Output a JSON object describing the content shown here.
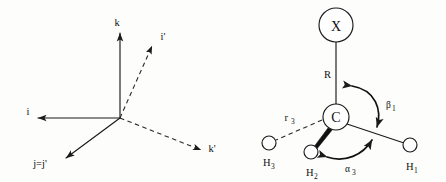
{
  "figure": {
    "background_color": "#fdfdfb",
    "ink_color": "#111111"
  },
  "left_panel": {
    "name": "coordinate-axes-diagram",
    "description": "Two overlaid right-handed coordinate frames sharing a common origin; unprimed frame drawn with solid arrows, primed frame drawn with dashed arrows, with j coincident with j-prime.",
    "axes": [
      {
        "id": "k",
        "label": "k",
        "style": "solid",
        "direction": "up"
      },
      {
        "id": "i",
        "label": "i",
        "style": "solid",
        "direction": "left"
      },
      {
        "id": "j",
        "label": "j=j'",
        "style": "solid",
        "direction": "down-left"
      },
      {
        "id": "iprime",
        "label": "i'",
        "style": "dashed",
        "direction": "up-right"
      },
      {
        "id": "kprime",
        "label": "k'",
        "style": "dashed",
        "direction": "down-right"
      }
    ]
  },
  "right_panel": {
    "name": "molecule-diagram",
    "description": "Substituted methyl group: central carbon bonded to substituent X and three hydrogens, annotated with bond length R, distance r3, bend angle beta1 and angle alpha3.",
    "atoms": [
      {
        "id": "X",
        "label": "X",
        "shape": "circle",
        "radius_px": 17
      },
      {
        "id": "C",
        "label": "C",
        "shape": "circle",
        "radius_px": 13
      },
      {
        "id": "H1",
        "label": "H",
        "subscript": "1",
        "shape": "circle",
        "radius_px": 7
      },
      {
        "id": "H2",
        "label": "H",
        "subscript": "2",
        "shape": "circle",
        "radius_px": 7
      },
      {
        "id": "H3",
        "label": "H",
        "subscript": "3",
        "shape": "circle",
        "radius_px": 7
      }
    ],
    "bonds": [
      {
        "from": "C",
        "to": "X",
        "style": "solid",
        "label": "R"
      },
      {
        "from": "C",
        "to": "H1",
        "style": "solid",
        "label": ""
      },
      {
        "from": "C",
        "to": "H2",
        "style": "wedge",
        "label": ""
      },
      {
        "from": "C",
        "to": "H3",
        "style": "dashed",
        "label": "r",
        "label_subscript": "3"
      }
    ],
    "angle_annotations": [
      {
        "id": "beta1",
        "label": "β",
        "subscript": "1",
        "between": [
          "C-X",
          "C-H1"
        ],
        "arrow": "double-headed-arc"
      },
      {
        "id": "alpha3",
        "label": "α",
        "subscript": "3",
        "between": [
          "C-H2",
          "C-H1"
        ],
        "arrow": "double-headed-arc"
      }
    ],
    "labels": {
      "R": "R",
      "r3_base": "r",
      "r3_sub": "3",
      "beta_base": "β",
      "beta_sub": "1",
      "alpha_base": "α",
      "alpha_sub": "3",
      "X": "X",
      "C": "C",
      "H_base": "H",
      "H1_sub": "1",
      "H2_sub": "2",
      "H3_sub": "3"
    }
  }
}
